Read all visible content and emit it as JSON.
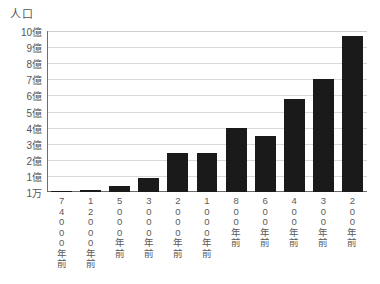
{
  "chart_data": {
    "type": "bar",
    "title": "人口",
    "xlabel": "",
    "ylabel": "人口",
    "categories": [
      "74000年前",
      "12000年前",
      "5000年前",
      "3000年前",
      "2000年前",
      "1000年前",
      "800年前",
      "600年前",
      "400年前",
      "300年前",
      "200年前"
    ],
    "category_chars": [
      [
        "7",
        "4",
        "0",
        "0",
        "0",
        "年",
        "前"
      ],
      [
        "1",
        "2",
        "0",
        "0",
        "0",
        "年",
        "前"
      ],
      [
        "5",
        "0",
        "0",
        "0",
        "年",
        "前"
      ],
      [
        "3",
        "0",
        "0",
        "0",
        "年",
        "前"
      ],
      [
        "2",
        "0",
        "0",
        "0",
        "年",
        "前"
      ],
      [
        "1",
        "0",
        "0",
        "0",
        "年",
        "前"
      ],
      [
        "8",
        "0",
        "0",
        "年",
        "前"
      ],
      [
        "6",
        "0",
        "0",
        "年",
        "前"
      ],
      [
        "4",
        "0",
        "0",
        "年",
        "前"
      ],
      [
        "3",
        "0",
        "0",
        "年",
        "前"
      ],
      [
        "2",
        "0",
        "0",
        "年",
        "前"
      ]
    ],
    "values": [
      0.01,
      0.1,
      0.35,
      0.9,
      2.4,
      2.45,
      4.0,
      3.5,
      5.8,
      7.0,
      9.7
    ],
    "value_unit": "億",
    "ylim": [
      0,
      10
    ],
    "y_ticks": [
      {
        "value": 10,
        "label": "10億"
      },
      {
        "value": 9,
        "label": "9億"
      },
      {
        "value": 8,
        "label": "8億"
      },
      {
        "value": 7,
        "label": "7億"
      },
      {
        "value": 6,
        "label": "6億"
      },
      {
        "value": 5,
        "label": "5億"
      },
      {
        "value": 4,
        "label": "4億"
      },
      {
        "value": 3,
        "label": "3億"
      },
      {
        "value": 2,
        "label": "2億"
      },
      {
        "value": 1,
        "label": "1億"
      },
      {
        "value": 0,
        "label": "1万"
      }
    ],
    "grid": true,
    "legend": null,
    "bar_color": "#1a1a1a",
    "grid_color": "#d8d8d8",
    "axis_color": "#6d6d6d"
  }
}
